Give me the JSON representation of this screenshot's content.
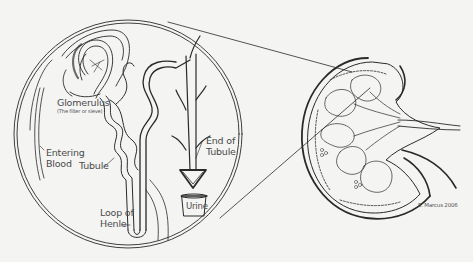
{
  "diagram": {
    "colors": {
      "background": "#f4f4f3",
      "stroke": "#2a2a2a",
      "label": "#4a4a4a"
    },
    "labels": {
      "glomerulus": "Glomerulus",
      "glomerulus_note": "(The filter or sieve)",
      "entering_blood_1": "Entering",
      "entering_blood_2": "Blood",
      "tubule": "Tubule",
      "loop_of_henle_1": "Loop of",
      "loop_of_henle_2": "Henle",
      "end_of_tubule_1": "End of",
      "end_of_tubule_2": "Tubule",
      "urine": "Urine"
    },
    "credit": "E. Marcus 2006",
    "elements": {
      "magnified_circle": "Magnified nephron inset",
      "kidney": "Kidney cross-section",
      "zoom_lines": "Lines linking kidney region to inset"
    }
  }
}
